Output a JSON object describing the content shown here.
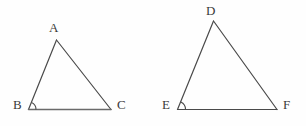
{
  "figure": {
    "background_color": "#fefefe",
    "stroke_color": "#4a4a4a",
    "base_stroke_color": "#6a6a6a",
    "label_color": "#3a3a3a",
    "stroke_width": 1.2,
    "canvas": {
      "width": 306,
      "height": 126
    },
    "shapes": [
      {
        "name": "triangle-abc",
        "vertices": [
          {
            "label": "A",
            "x": 56.5,
            "y": 40.0,
            "label_x": 49,
            "label_y": 21
          },
          {
            "label": "B",
            "x": 28.5,
            "y": 109.5,
            "label_x": 13,
            "label_y": 98
          },
          {
            "label": "C",
            "x": 111.0,
            "y": 109.5,
            "label_x": 117,
            "label_y": 98
          }
        ],
        "angle_marks": [
          {
            "at": "B",
            "radius": 7.5,
            "name": "angle-arc-b"
          }
        ]
      },
      {
        "name": "triangle-def",
        "vertices": [
          {
            "label": "D",
            "x": 213.5,
            "y": 21.0,
            "label_x": 206,
            "label_y": 4
          },
          {
            "label": "E",
            "x": 177.5,
            "y": 109.5,
            "label_x": 162,
            "label_y": 98
          },
          {
            "label": "F",
            "x": 277.0,
            "y": 109.5,
            "label_x": 283,
            "label_y": 98
          }
        ],
        "angle_marks": [
          {
            "at": "E",
            "radius": 8.0,
            "name": "angle-arc-e"
          }
        ]
      }
    ],
    "labels": {
      "a": "A",
      "b": "B",
      "c": "C",
      "d": "D",
      "e": "E",
      "f": "F"
    }
  }
}
